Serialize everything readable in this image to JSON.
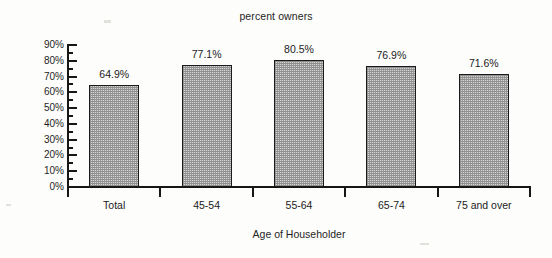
{
  "chart_data": {
    "type": "bar",
    "title": "percent owners",
    "xlabel": "Age of Householder",
    "ylabel": "",
    "categories": [
      "Total",
      "45-54",
      "55-64",
      "65-74",
      "75 and over"
    ],
    "values": [
      64.9,
      77.1,
      80.5,
      76.9,
      71.6
    ],
    "value_labels": [
      "64.9%",
      "77.1%",
      "80.5%",
      "76.9%",
      "71.6%"
    ],
    "ylim": [
      0,
      90
    ],
    "ytick_labels": [
      "90%",
      "80%",
      "70%",
      "60%",
      "50%",
      "40%",
      "30%",
      "20%",
      "10%",
      "0%"
    ],
    "ytick_values": [
      90,
      80,
      70,
      60,
      50,
      40,
      30,
      20,
      10,
      0
    ],
    "minor_tick_step": 5,
    "grid": false,
    "legend": false,
    "bar_fill": "#d6d6d6",
    "bar_border": "#1a1a1a",
    "axis_color": "#161616",
    "background": "#fdfdfb"
  }
}
